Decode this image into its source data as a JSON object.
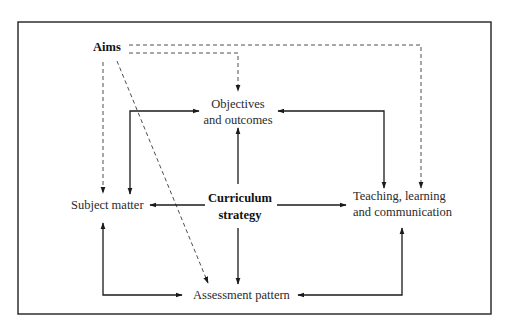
{
  "diagram": {
    "nodes": {
      "aims": "Aims",
      "objectives_line1": "Objectives",
      "objectives_line2": "and outcomes",
      "curriculum_line1": "Curriculum",
      "curriculum_line2": "strategy",
      "subject_matter": "Subject matter",
      "teaching_line1": "Teaching, learning",
      "teaching_line2": "and communication",
      "assessment": "Assessment pattern"
    },
    "edges": [
      {
        "from": "Aims",
        "to": "Objectives and outcomes",
        "style": "dashed"
      },
      {
        "from": "Aims",
        "to": "Teaching, learning and communication",
        "style": "dashed"
      },
      {
        "from": "Aims",
        "to": "Subject matter",
        "style": "dashed"
      },
      {
        "from": "Aims",
        "to": "Assessment pattern",
        "style": "dashed"
      },
      {
        "from": "Curriculum strategy",
        "to": "Objectives and outcomes",
        "style": "solid"
      },
      {
        "from": "Curriculum strategy",
        "to": "Subject matter",
        "style": "solid"
      },
      {
        "from": "Curriculum strategy",
        "to": "Teaching, learning and communication",
        "style": "solid"
      },
      {
        "from": "Curriculum strategy",
        "to": "Assessment pattern",
        "style": "solid"
      },
      {
        "from": "Subject matter",
        "to": "Objectives and outcomes",
        "style": "solid",
        "bidirectional": true
      },
      {
        "from": "Teaching, learning and communication",
        "to": "Objectives and outcomes",
        "style": "solid",
        "bidirectional": true
      },
      {
        "from": "Subject matter",
        "to": "Assessment pattern",
        "style": "solid",
        "bidirectional": true
      },
      {
        "from": "Teaching, learning and communication",
        "to": "Assessment pattern",
        "style": "solid",
        "bidirectional": true
      }
    ]
  }
}
